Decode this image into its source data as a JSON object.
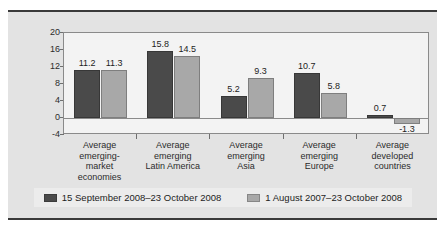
{
  "chart_data": {
    "type": "bar",
    "title": "",
    "subtitle": "",
    "xlabel": "",
    "ylabel": "",
    "ylim": [
      -4,
      20
    ],
    "yticks": [
      20,
      16,
      12,
      8,
      4,
      0,
      -4
    ],
    "grid": false,
    "legend_position": "bottom",
    "categories": [
      "Average emerging-market economies",
      "Average emerging Latin America",
      "Average emerging Asia",
      "Average emerging Europe",
      "Average developed countries"
    ],
    "category_lines": [
      [
        "Average",
        "emerging-",
        "market",
        "economies"
      ],
      [
        "Average",
        "emerging",
        "Latin America"
      ],
      [
        "Average",
        "emerging",
        "Asia"
      ],
      [
        "Average",
        "emerging",
        "Europe"
      ],
      [
        "Average",
        "developed",
        "countries"
      ]
    ],
    "series": [
      {
        "name": "15 September 2008–23 October 2008",
        "color": "#4a4a4a",
        "values": [
          11.2,
          15.8,
          5.2,
          10.7,
          0.7
        ],
        "labels": [
          "11.2",
          "15.8",
          "5.2",
          "10.7",
          "0.7"
        ]
      },
      {
        "name": "1 August 2007–23 October 2008",
        "color": "#a8a8a8",
        "values": [
          11.3,
          14.5,
          9.3,
          5.8,
          -1.3
        ],
        "labels": [
          "11.3",
          "14.5",
          "9.3",
          "5.8",
          "-1.3"
        ]
      }
    ]
  },
  "legend": {
    "items": [
      {
        "label": "15 September 2008–23 October 2008",
        "color": "#4a4a4a"
      },
      {
        "label": "1 August 2007–23 October 2008",
        "color": "#a8a8a8"
      }
    ]
  },
  "axis": {
    "ytick_labels": [
      "20",
      "16",
      "12",
      "8",
      "4",
      "0",
      "-4"
    ]
  },
  "colors": {
    "series_dark": "#4a4a4a",
    "series_light": "#a8a8a8",
    "panel_background": "#e3e3e3",
    "plot_background": "#f3f3f3",
    "frame_border": "#3a3a3a",
    "axis_line": "#8a8a8a",
    "text": "#1d1d1d"
  }
}
